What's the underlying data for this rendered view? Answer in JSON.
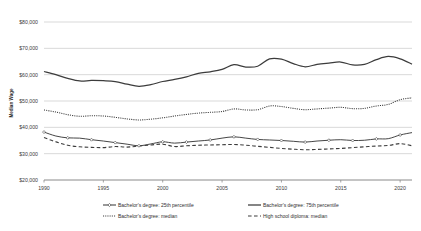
{
  "chart_data": {
    "type": "line",
    "title": "",
    "xlabel": "",
    "ylabel": "Median Wage",
    "xlim": [
      1990,
      2021
    ],
    "ylim": [
      20000,
      80000
    ],
    "grid": true,
    "legend_position": "bottom",
    "y_ticks": [
      "$20,000",
      "$30,000",
      "$40,000",
      "$50,000",
      "$60,000",
      "$70,000",
      "$80,000"
    ],
    "y_tick_values": [
      20000,
      30000,
      40000,
      50000,
      60000,
      70000,
      80000
    ],
    "x_ticks": [
      "1990",
      "1995",
      "2000",
      "2005",
      "2010",
      "2015",
      "2020"
    ],
    "x_tick_values": [
      1990,
      1995,
      2000,
      2005,
      2010,
      2015,
      2020
    ],
    "x": [
      1990,
      1991,
      1992,
      1993,
      1994,
      1995,
      1996,
      1997,
      1998,
      1999,
      2000,
      2001,
      2002,
      2003,
      2004,
      2005,
      2006,
      2007,
      2008,
      2009,
      2010,
      2011,
      2012,
      2013,
      2014,
      2015,
      2016,
      2017,
      2018,
      2019,
      2020,
      2021
    ],
    "series": [
      {
        "name": "Bachelor's degree: 75th percentile",
        "style": "solid",
        "marker": "none",
        "values": [
          61200,
          60000,
          58600,
          57600,
          57800,
          57700,
          57400,
          56400,
          55600,
          56200,
          57400,
          58200,
          59200,
          60500,
          61100,
          62000,
          63800,
          62900,
          63200,
          66000,
          65900,
          64200,
          63000,
          63900,
          64400,
          64800,
          63700,
          63900,
          65700,
          66900,
          66000,
          64000
        ]
      },
      {
        "name": "Bachelor's degree: median",
        "style": "dotted",
        "marker": "none",
        "values": [
          46600,
          45800,
          44800,
          44200,
          44400,
          44300,
          43800,
          43200,
          42800,
          43100,
          43600,
          44300,
          44900,
          45400,
          45700,
          46000,
          47000,
          46600,
          46700,
          48100,
          47900,
          47200,
          46700,
          47000,
          47300,
          47600,
          47100,
          47200,
          48100,
          48700,
          50500,
          51200
        ]
      },
      {
        "name": "Bachelor's degree: 25th percentile",
        "style": "solid",
        "marker": "diamond",
        "values": [
          38200,
          36700,
          36000,
          35900,
          35300,
          34800,
          34200,
          33600,
          33000,
          33700,
          34500,
          34000,
          34400,
          34800,
          35200,
          35900,
          36400,
          35900,
          35400,
          35200,
          35000,
          34700,
          34400,
          34800,
          35100,
          35300,
          35000,
          35100,
          35600,
          35700,
          37100,
          38000
        ]
      },
      {
        "name": "High school diploma: median",
        "style": "dashed",
        "marker": "none",
        "values": [
          36100,
          34500,
          33200,
          32600,
          32400,
          32300,
          32700,
          32500,
          32900,
          33300,
          33600,
          32700,
          33000,
          33200,
          33300,
          33400,
          33500,
          33200,
          32800,
          32400,
          32000,
          31700,
          31500,
          31600,
          31800,
          32000,
          32300,
          32600,
          32900,
          33100,
          33800,
          33000
        ]
      }
    ]
  },
  "legend": {
    "items": [
      {
        "label": "Bachelor's degree: 25th percentile",
        "style": "solid-marker"
      },
      {
        "label": "Bachelor's degree: median",
        "style": "dotted"
      },
      {
        "label": "Bachelor's degree: 75th percentile",
        "style": "solid"
      },
      {
        "label": "High school diploma: median",
        "style": "dashed"
      }
    ]
  }
}
